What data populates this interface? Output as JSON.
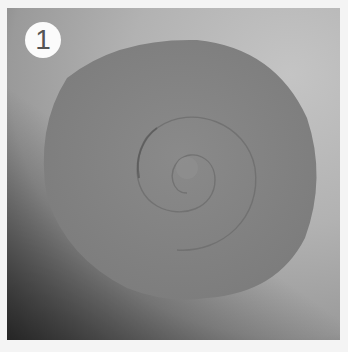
{
  "step": {
    "number": "1"
  },
  "scene": {
    "description": "Grey paper circle cut into a spiral for a rolled paper flower",
    "colors": {
      "background": "#b4b4b4",
      "disc": "#838383",
      "spiral_line": "#6f6f6f",
      "border": "#f4f4f4"
    }
  }
}
